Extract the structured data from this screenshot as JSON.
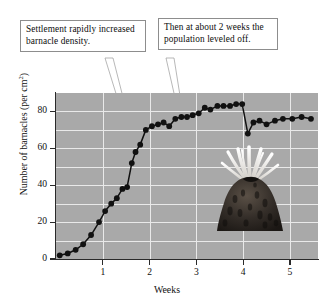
{
  "chart_data": {
    "type": "line",
    "title": "",
    "xlabel": "Weeks",
    "ylabel": "Number of barnacles (per cm²)",
    "xlim": [
      0,
      5.6
    ],
    "ylim": [
      0,
      90
    ],
    "xticks": [
      1,
      2,
      3,
      4,
      5
    ],
    "yticks": [
      0,
      20,
      40,
      60,
      80
    ],
    "grid": true,
    "legend": false,
    "marker": "filled-circle",
    "line_color": "#111111",
    "plot_background": "#a9a9a9",
    "gridline_color": "#e9e9e9",
    "series": [
      {
        "name": "Barnacle density",
        "x": [
          0.08,
          0.25,
          0.42,
          0.58,
          0.75,
          0.92,
          1.05,
          1.18,
          1.3,
          1.42,
          1.52,
          1.62,
          1.7,
          1.8,
          1.92,
          2.05,
          2.18,
          2.3,
          2.42,
          2.55,
          2.68,
          2.8,
          2.92,
          3.05,
          3.18,
          3.3,
          3.45,
          3.58,
          3.72,
          3.85,
          3.98,
          4.1,
          4.22,
          4.35,
          4.5,
          4.68,
          4.85,
          5.05,
          5.25,
          5.45
        ],
        "y": [
          2,
          3,
          5,
          8,
          13,
          20,
          26,
          30,
          33,
          38,
          39,
          52,
          58,
          62,
          70,
          72,
          73,
          74,
          72,
          76,
          77,
          77,
          78,
          79,
          82,
          81,
          83,
          83,
          83,
          84,
          84,
          68,
          74,
          75,
          73,
          75,
          76,
          76,
          77,
          76
        ]
      }
    ]
  },
  "annotations": [
    {
      "id": "callout-1",
      "text": "Settlement rapidly increased barnacle density.",
      "points_to_week": 1.6,
      "points_to_value": 38
    },
    {
      "id": "callout-2",
      "text": "Then at about 2 weeks the population leveled off.",
      "points_to_week": 2.05,
      "points_to_value": 72
    }
  ],
  "illustration": {
    "name": "barnacle",
    "shell_color": "#2b2724",
    "cirri_color": "#f2f0ec"
  }
}
